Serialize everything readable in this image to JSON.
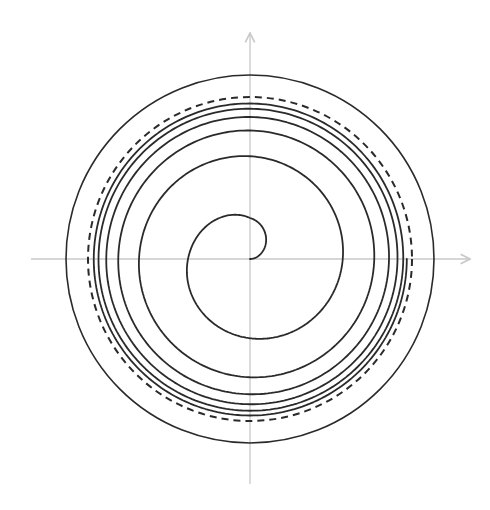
{
  "figure": {
    "kind": "phase-portrait",
    "width": 490,
    "height": 510,
    "background": "#ffffff"
  },
  "axes": {
    "color": "#c8c8c8",
    "stroke_width": 1.3,
    "origin": {
      "x": 250,
      "y": 259
    },
    "x_axis": {
      "from": 31,
      "to": 470,
      "arrow": true
    },
    "y_axis": {
      "from": 484,
      "to": 33,
      "arrow": true
    }
  },
  "outer_circle": {
    "cx": 250,
    "cy": 259,
    "r": 184,
    "stroke": "#2a2a2a",
    "stroke_width": 1.6,
    "dashed": false
  },
  "limit_cycle": {
    "cx": 250,
    "cy": 259,
    "r": 162,
    "stroke": "#2a2a2a",
    "stroke_width": 2,
    "dashed": true,
    "dasharray": "7,5"
  },
  "spiral": {
    "cx": 250,
    "cy": 259,
    "stroke": "#2a2a2a",
    "stroke_width": 1.8,
    "direction": "counterclockwise",
    "start_angle_deg": 0,
    "quarter_turn_radii": [
      0,
      41,
      62,
      81,
      93,
      104,
      110,
      120,
      123,
      131,
      129,
      138,
      136,
      146,
      140,
      149,
      143,
      155,
      148,
      155,
      149,
      160,
      153,
      159,
      155
    ]
  }
}
